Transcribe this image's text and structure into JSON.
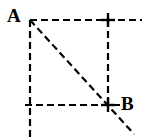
{
  "figure": {
    "type": "geometry-diagram",
    "background_color": "#ffffff",
    "stroke_color": "#000000",
    "stroke_width": 2.2,
    "dash_pattern": "7 4",
    "width": 146,
    "height": 140,
    "labels": [
      {
        "id": "A",
        "text": "A",
        "x": 7,
        "y": 6,
        "anchors_point": "top-left-corner"
      },
      {
        "id": "B",
        "text": "B",
        "x": 121,
        "y": 94,
        "anchors_point": "bottom-right-corner"
      }
    ],
    "points": [
      {
        "id": "A",
        "x": 30,
        "y": 20
      },
      {
        "id": "B",
        "x": 108,
        "y": 105
      }
    ],
    "markers": [
      {
        "id": "marker-top-right",
        "x": 108,
        "y": 20,
        "glyph": "plus"
      },
      {
        "id": "marker-bottom-right",
        "x": 108,
        "y": 105,
        "glyph": "plus"
      }
    ],
    "segments": [
      {
        "id": "top-horizontal",
        "x1": 30,
        "y1": 20,
        "x2": 142,
        "y2": 20
      },
      {
        "id": "bottom-horizontal",
        "x1": 25,
        "y1": 105,
        "x2": 120,
        "y2": 105
      },
      {
        "id": "left-vertical",
        "x1": 30,
        "y1": 20,
        "x2": 30,
        "y2": 138
      },
      {
        "id": "right-vertical",
        "x1": 108,
        "y1": 20,
        "x2": 108,
        "y2": 105
      },
      {
        "id": "diagonal",
        "x1": 30,
        "y1": 20,
        "x2": 134,
        "y2": 134
      }
    ]
  }
}
